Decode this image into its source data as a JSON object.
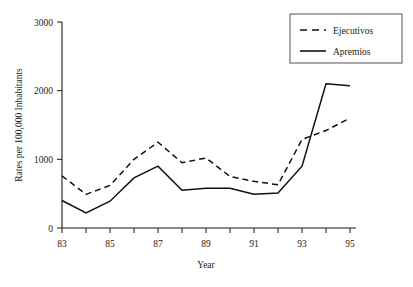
{
  "chart_data": {
    "type": "line",
    "title": "",
    "xlabel": "Year",
    "ylabel": "Rates per 100,000 Inhabitants",
    "x": [
      83,
      84,
      85,
      86,
      87,
      88,
      89,
      90,
      91,
      92,
      93,
      94,
      95
    ],
    "xtick_values": [
      83,
      84,
      85,
      86,
      87,
      88,
      89,
      90,
      91,
      92,
      93,
      94,
      95
    ],
    "xtick_labels": [
      "83",
      "",
      "85",
      "",
      "87",
      "",
      "89",
      "",
      "91",
      "",
      "93",
      "",
      "95"
    ],
    "xlim": [
      83,
      95
    ],
    "ytick_values": [
      0,
      1000,
      2000,
      3000
    ],
    "ytick_labels": [
      "0",
      "1000",
      "2000",
      "3000"
    ],
    "ylim": [
      0,
      3000
    ],
    "grid": false,
    "legend_position": "top-right",
    "series": [
      {
        "name": "Ejecutivos",
        "style": "dashed",
        "color": "#111111",
        "values": [
          760,
          490,
          620,
          1000,
          1250,
          950,
          1020,
          750,
          680,
          630,
          1290,
          1420,
          1600
        ]
      },
      {
        "name": "Apremios",
        "style": "solid",
        "color": "#111111",
        "values": [
          400,
          220,
          390,
          730,
          900,
          550,
          580,
          580,
          490,
          510,
          900,
          2100,
          2070
        ]
      }
    ]
  }
}
